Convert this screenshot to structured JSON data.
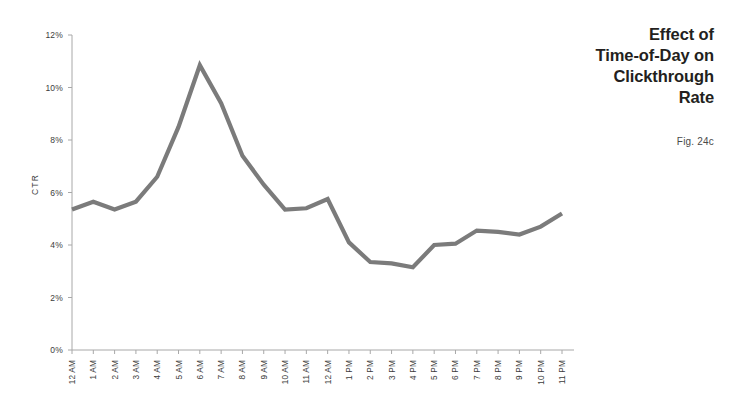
{
  "title": {
    "text": "Effect of\nTime-of-Day on\nClickthrough\nRate",
    "caption": "Fig. 24c"
  },
  "colors": {
    "line": "#7b7b7b",
    "axis": "#a8a8a8",
    "text": "#231f20",
    "tick_text": "#3c3c3c",
    "background": "#ffffff"
  },
  "chart_data": {
    "type": "line",
    "title": "Effect of Time-of-Day on Clickthrough Rate",
    "xlabel": "",
    "ylabel": "CTR",
    "ylim": [
      0,
      12
    ],
    "ytick_labels": [
      "0%",
      "2%",
      "4%",
      "6%",
      "8%",
      "10%",
      "12%"
    ],
    "ytick_values": [
      0,
      2,
      4,
      6,
      8,
      10,
      12
    ],
    "grid": false,
    "legend": false,
    "categories": [
      "12 AM",
      "1 AM",
      "2 AM",
      "3 AM",
      "4 AM",
      "5 AM",
      "6 AM",
      "7 AM",
      "8 AM",
      "9 AM",
      "10 AM",
      "11 AM",
      "12 AM",
      "1 PM",
      "2 PM",
      "3 PM",
      "4 PM",
      "5 PM",
      "6 PM",
      "7 PM",
      "8 PM",
      "9 PM",
      "10 PM",
      "11 PM"
    ],
    "values": [
      5.35,
      5.65,
      5.35,
      5.65,
      6.6,
      8.5,
      10.85,
      9.4,
      7.4,
      6.3,
      5.35,
      5.4,
      5.75,
      4.1,
      3.35,
      3.3,
      3.15,
      4.0,
      4.05,
      4.55,
      4.5,
      4.4,
      4.7,
      5.2
    ]
  }
}
